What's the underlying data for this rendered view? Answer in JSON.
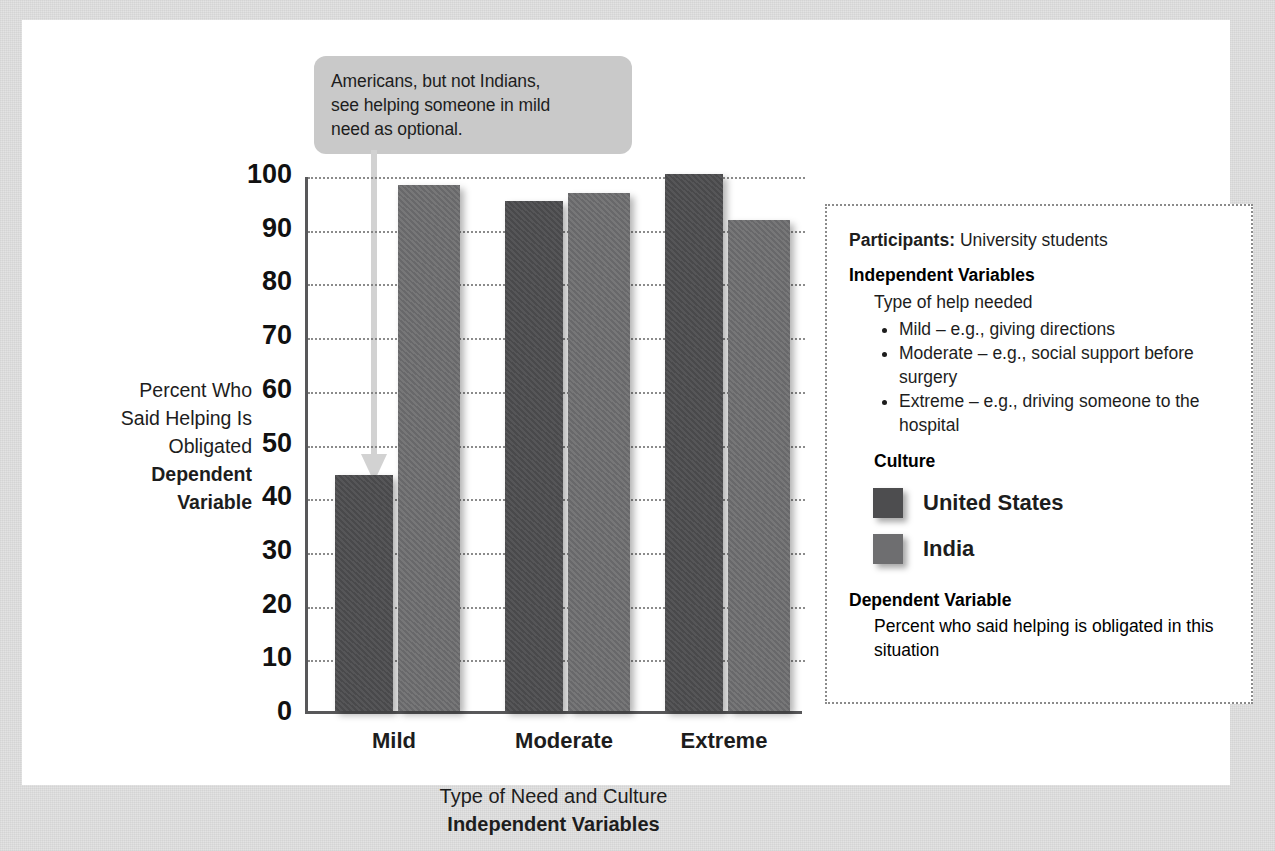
{
  "callout": {
    "lines": [
      "Americans, but not Indians,",
      "see helping someone in mild",
      "need as optional."
    ]
  },
  "axes": {
    "y_title_lines": [
      "Percent Who",
      "Said Helping Is",
      "Obligated"
    ],
    "y_title_bold_lines": [
      "Dependent",
      "Variable"
    ],
    "x_title_line": "Type of Need and Culture",
    "x_title_bold_line": "Independent Variables",
    "y_ticks": [
      "100",
      "90",
      "80",
      "70",
      "60",
      "50",
      "40",
      "30",
      "20",
      "10",
      "0"
    ]
  },
  "info_box": {
    "participants_label": "Participants:",
    "participants_value": "University students",
    "iv_heading": "Independent Variables",
    "iv_sub": "Type of help needed",
    "iv_bullets": [
      "Mild – e.g., giving directions",
      "Moderate – e.g., social support before surgery",
      "Extreme – e.g., driving someone to the hospital"
    ],
    "culture_heading": "Culture",
    "legend": [
      {
        "label": "United States",
        "color": "#4d4d4f"
      },
      {
        "label": "India",
        "color": "#6e6e70"
      }
    ],
    "dv_heading": "Dependent Variable",
    "dv_text": "Percent who said helping is obligated in this situation"
  },
  "chart_data": {
    "type": "bar",
    "title": "",
    "categories": [
      "Mild",
      "Moderate",
      "Extreme"
    ],
    "series": [
      {
        "name": "United States",
        "values": [
          44,
          95,
          100
        ],
        "color": "#4d4d4f"
      },
      {
        "name": "India",
        "values": [
          98,
          96.5,
          91.5
        ],
        "color": "#6e6e70"
      }
    ],
    "xlabel": "Type of Need and Culture / Independent Variables",
    "ylabel": "Percent Who Said Helping Is Obligated / Dependent Variable",
    "ylim": [
      0,
      100
    ],
    "ytick_step": 10,
    "grid": "horizontal-dotted",
    "legend_position": "right-box"
  }
}
